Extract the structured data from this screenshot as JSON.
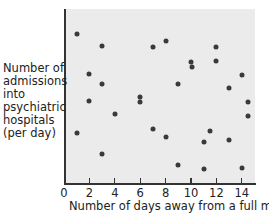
{
  "chart_data": {
    "type": "scatter",
    "title": "",
    "xlabel": "Number of days away from a full moon",
    "ylabel": "Number of admissions into psychiatric hospitals (per day)",
    "ylabel_lines": [
      "Number of",
      "admissions",
      "into",
      "psychiatric",
      "hospitals",
      "(per day)"
    ],
    "xlim": [
      0,
      15
    ],
    "ylim": [
      0,
      174
    ],
    "x_ticks": [
      0,
      2,
      4,
      6,
      8,
      10,
      12,
      14
    ],
    "x_tick_labels": [
      "0",
      "2",
      "4",
      "6",
      "8",
      "10",
      "12",
      "14"
    ],
    "y_ticks": [],
    "y_note": "No numeric y-axis scale shown; y values are relative heights above the x-axis",
    "grid": false,
    "legend": null,
    "marker_color": "#3a3a3a",
    "background_color": "#ebebeb",
    "points": [
      {
        "x": 1,
        "y": 149
      },
      {
        "x": 3,
        "y": 137
      },
      {
        "x": 7,
        "y": 136
      },
      {
        "x": 8,
        "y": 142
      },
      {
        "x": 12,
        "y": 136
      },
      {
        "x": 10,
        "y": 121
      },
      {
        "x": 10.1,
        "y": 116
      },
      {
        "x": 12,
        "y": 122
      },
      {
        "x": 2,
        "y": 109
      },
      {
        "x": 14,
        "y": 108
      },
      {
        "x": 3,
        "y": 99
      },
      {
        "x": 9,
        "y": 99
      },
      {
        "x": 13,
        "y": 95
      },
      {
        "x": 6,
        "y": 86
      },
      {
        "x": 6,
        "y": 81
      },
      {
        "x": 2,
        "y": 82
      },
      {
        "x": 14.5,
        "y": 81
      },
      {
        "x": 4,
        "y": 69
      },
      {
        "x": 14.5,
        "y": 67
      },
      {
        "x": 1,
        "y": 50
      },
      {
        "x": 7,
        "y": 54
      },
      {
        "x": 8,
        "y": 46
      },
      {
        "x": 11.5,
        "y": 52
      },
      {
        "x": 11,
        "y": 41
      },
      {
        "x": 13,
        "y": 43
      },
      {
        "x": 3,
        "y": 29
      },
      {
        "x": 9,
        "y": 18
      },
      {
        "x": 11,
        "y": 14
      },
      {
        "x": 14,
        "y": 15
      }
    ]
  }
}
